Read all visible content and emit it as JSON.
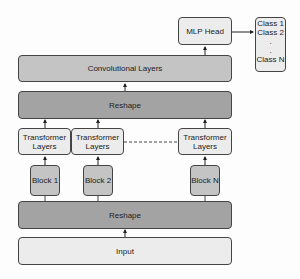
{
  "diagram": {
    "mlp_head": "MLP Head",
    "classes": [
      "Class 1",
      "Class 2",
      ".",
      ".",
      "Class N"
    ],
    "conv_layers": "Convolutional Layers",
    "reshape_top": "Reshape",
    "transformers": [
      {
        "line1": "Transformer",
        "line2": "Layers"
      },
      {
        "line1": "Transformer",
        "line2": "Layers"
      },
      {
        "line1": "Transformer",
        "line2": "Layers"
      }
    ],
    "blocks": [
      "Block 1",
      "Block 2",
      "Block N"
    ],
    "reshape_bottom": "Reshape",
    "input": "Input"
  }
}
